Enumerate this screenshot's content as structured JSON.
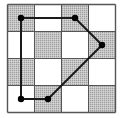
{
  "diagram": {
    "type": "grid-polygon",
    "grid": {
      "rows": 4,
      "cols": 4,
      "origin_x": 7.5,
      "origin_y": 4.5,
      "cell_size": 27
    },
    "colors": {
      "shaded": "#b8b8b8",
      "white": "#ffffff",
      "line": "#1a1a1a",
      "vertex": "#000000"
    },
    "shading": [
      [
        1,
        0,
        1,
        0
      ],
      [
        0,
        1,
        0,
        1
      ],
      [
        1,
        0,
        1,
        0
      ],
      [
        0,
        1,
        0,
        1
      ]
    ],
    "polygon_vertices": [
      {
        "col": 0,
        "row": 0
      },
      {
        "col": 2,
        "row": 0
      },
      {
        "col": 3,
        "row": 1
      },
      {
        "col": 1,
        "row": 3
      },
      {
        "col": 0,
        "row": 3
      }
    ]
  }
}
